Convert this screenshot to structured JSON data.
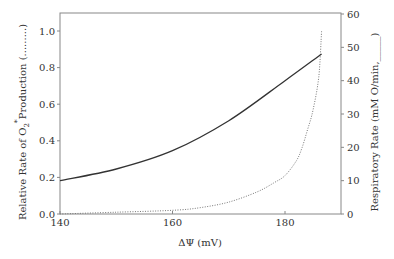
{
  "chart_data": {
    "type": "line",
    "title": "",
    "xlabel": "ΔΨ (mV)",
    "ylabel_left": "Relative Rate of O2*Production (.........)",
    "ylabel_left_parts": {
      "pre": "Relative Rate of O",
      "sub": "2",
      "sup": "*",
      "post": "Production (.........)"
    },
    "ylabel_right": "Respiratory Rate (mM O/min,_____)",
    "xlim": [
      140,
      190
    ],
    "ylim_left": [
      0,
      1.1
    ],
    "ylim_right": [
      0,
      60
    ],
    "x_ticks": [
      140,
      160,
      180
    ],
    "y_left_ticks": [
      "0.0",
      "0.2",
      "0.4",
      "0.6",
      "0.8",
      "1.0"
    ],
    "y_right_ticks": [
      "0",
      "10",
      "20",
      "30",
      "40",
      "50",
      "60"
    ],
    "grid": false,
    "series": [
      {
        "name": "Relative Rate of O2* Production",
        "axis": "left",
        "style": "dotted",
        "x": [
          140,
          150,
          160,
          165,
          170,
          175,
          178,
          180,
          182,
          183,
          184,
          185,
          186,
          186.5
        ],
        "values": [
          0.0,
          0.01,
          0.02,
          0.035,
          0.065,
          0.12,
          0.17,
          0.21,
          0.29,
          0.36,
          0.46,
          0.57,
          0.75,
          1.0
        ]
      },
      {
        "name": "Respiratory Rate",
        "axis": "right",
        "style": "solid",
        "x": [
          140,
          150,
          160,
          170,
          180,
          186.5
        ],
        "values": [
          10,
          13.5,
          19,
          28,
          40,
          48
        ]
      }
    ]
  }
}
